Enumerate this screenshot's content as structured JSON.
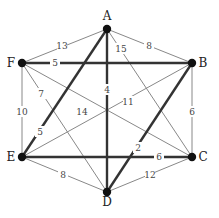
{
  "graph": {
    "nodes": [
      {
        "id": "A",
        "x": 107,
        "y": 29,
        "lx": 107,
        "ly": 20
      },
      {
        "id": "B",
        "x": 192,
        "y": 63,
        "lx": 203,
        "ly": 67
      },
      {
        "id": "C",
        "x": 192,
        "y": 157,
        "lx": 203,
        "ly": 161
      },
      {
        "id": "D",
        "x": 107,
        "y": 192,
        "lx": 107,
        "ly": 206
      },
      {
        "id": "E",
        "x": 22,
        "y": 157,
        "lx": 11,
        "ly": 161
      },
      {
        "id": "F",
        "x": 22,
        "y": 63,
        "lx": 11,
        "ly": 67
      }
    ],
    "edges": [
      {
        "from": "A",
        "to": "F",
        "w": "13",
        "bold": false,
        "wx": 62,
        "wy": 46
      },
      {
        "from": "A",
        "to": "B",
        "w": "8",
        "bold": false,
        "wx": 149,
        "wy": 46
      },
      {
        "from": "A",
        "to": "C",
        "w": "15",
        "bold": false,
        "wx": 121,
        "wy": 49
      },
      {
        "from": "B",
        "to": "C",
        "w": "6",
        "bold": false,
        "wx": 192,
        "wy": 112
      },
      {
        "from": "C",
        "to": "D",
        "w": "12",
        "bold": false,
        "wx": 150,
        "wy": 175
      },
      {
        "from": "D",
        "to": "E",
        "w": "8",
        "bold": false,
        "wx": 63,
        "wy": 175
      },
      {
        "from": "E",
        "to": "F",
        "w": "10",
        "bold": false,
        "wx": 22,
        "wy": 112
      },
      {
        "from": "F",
        "to": "D",
        "w": "7",
        "bold": false,
        "wx": 41,
        "wy": 94
      },
      {
        "from": "F",
        "to": "C",
        "w": "14",
        "bold": false,
        "wx": 82,
        "wy": 112
      },
      {
        "from": "E",
        "to": "B",
        "w": "11",
        "bold": false,
        "wx": 128,
        "wy": 102
      },
      {
        "from": "A",
        "to": "E",
        "w": "5",
        "bold": true,
        "wx": 40,
        "wy": 132
      },
      {
        "from": "A",
        "to": "D",
        "w": "4",
        "bold": true,
        "wx": 107,
        "wy": 90
      },
      {
        "from": "F",
        "to": "B",
        "w": "5",
        "bold": true,
        "wx": 55,
        "wy": 63
      },
      {
        "from": "E",
        "to": "C",
        "w": "6",
        "bold": true,
        "wx": 159,
        "wy": 157
      },
      {
        "from": "D",
        "to": "B",
        "w": "2",
        "bold": true,
        "wx": 138,
        "wy": 148
      }
    ]
  }
}
